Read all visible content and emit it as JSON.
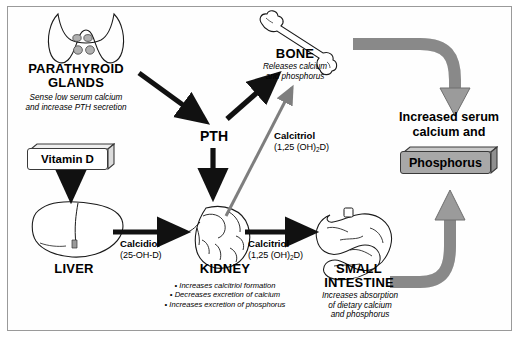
{
  "diagram": {
    "colors": {
      "outline": "#1a1a1a",
      "gray_arrow": "#8c8c8c",
      "gray_arrow_dark": "#6e6e6e",
      "phosphorus_box_fill": "#a8a8a8",
      "frame_border": "#9a9a9a",
      "background": "#ffffff"
    },
    "nodes": {
      "parathyroid": {
        "title_line1": "PARATHYROID",
        "title_line2": "GLANDS",
        "desc_line1": "Sense low serum calcium",
        "desc_line2": "and  increase PTH secretion",
        "icon": "parathyroid-glands-icon"
      },
      "vitamin_d": {
        "label": "Vitamin D",
        "icon": "vitamin-d-box-icon"
      },
      "liver": {
        "title": "LIVER",
        "icon": "liver-icon"
      },
      "kidney": {
        "title": "KIDNEY",
        "bullets": [
          "• Increases calcitriol formation",
          "• Decreases excretion of calcium",
          "• Increases excretion of phosphorus"
        ],
        "icon": "kidney-icon"
      },
      "small_intestine": {
        "title_line1": "SMALL",
        "title_line2": "INTESTINE",
        "desc_line1": "Increases absorption",
        "desc_line2": "of dietary calcium",
        "desc_line3": "and phosphorus",
        "icon": "small-intestine-icon"
      },
      "bone": {
        "title": "BONE",
        "desc_line1": "Releases calcium",
        "desc_line2": "and phosphorus",
        "icon": "bone-icon"
      },
      "pth": {
        "label": "PTH"
      },
      "outcome": {
        "line1": "Increased serum",
        "line2": "calcium and",
        "boxed_label": "Phosphorus"
      }
    },
    "mediators": {
      "calcidiol": {
        "name": "Calcidiol",
        "formula": "(25-OH-D)"
      },
      "calcitriol_kidney_intestine": {
        "name": "Calcitriol",
        "formula_pre": "(1,25 (OH)",
        "formula_sub": "2",
        "formula_post": "D)"
      },
      "calcitriol_kidney_bone": {
        "name": "Calcitriol",
        "formula_pre": "(1,25 (OH)",
        "formula_sub": "2",
        "formula_post": "D)"
      }
    },
    "arrows": [
      {
        "name": "parathyroid-to-pth",
        "style": "black-solid"
      },
      {
        "name": "bone-to-pth",
        "style": "black-solid"
      },
      {
        "name": "pth-to-kidney",
        "style": "black-solid"
      },
      {
        "name": "vitamin-d-to-liver",
        "style": "black-solid"
      },
      {
        "name": "liver-to-kidney",
        "style": "black-solid"
      },
      {
        "name": "kidney-to-small-intestine",
        "style": "black-solid"
      },
      {
        "name": "kidney-to-bone-calcitriol",
        "style": "gray-solid"
      },
      {
        "name": "bone-to-outcome",
        "style": "gray-thick-curved"
      },
      {
        "name": "small-intestine-to-outcome",
        "style": "gray-thick-curved"
      }
    ]
  }
}
